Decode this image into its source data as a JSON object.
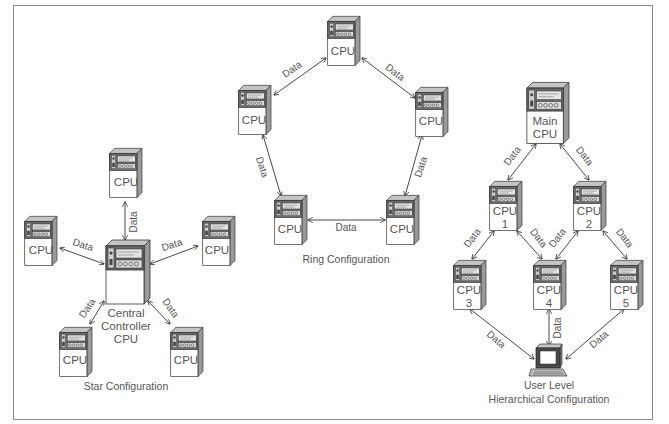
{
  "diagram": {
    "link_label": "Data",
    "cpu_label": "CPU",
    "star": {
      "caption": "Star Configuration",
      "center_lines": [
        "Central",
        "Controller",
        "CPU"
      ],
      "nodes": [
        {
          "id": "top",
          "label": "CPU"
        },
        {
          "id": "left",
          "label": "CPU"
        },
        {
          "id": "right",
          "label": "CPU"
        },
        {
          "id": "bottom-left",
          "label": "CPU"
        },
        {
          "id": "bottom-right",
          "label": "CPU"
        }
      ]
    },
    "ring": {
      "caption": "Ring Configuration",
      "nodes": [
        {
          "id": "top",
          "label": "CPU"
        },
        {
          "id": "upper-left",
          "label": "CPU"
        },
        {
          "id": "upper-right",
          "label": "CPU"
        },
        {
          "id": "lower-left",
          "label": "CPU"
        },
        {
          "id": "lower-right",
          "label": "CPU"
        }
      ]
    },
    "hierarchical": {
      "caption": "Hierarchical Configuration",
      "main_lines": [
        "Main",
        "CPU"
      ],
      "nodes": [
        {
          "id": "cpu1",
          "line1": "CPU",
          "line2": "1"
        },
        {
          "id": "cpu2",
          "line1": "CPU",
          "line2": "2"
        },
        {
          "id": "cpu3",
          "line1": "CPU",
          "line2": "3"
        },
        {
          "id": "cpu4",
          "line1": "CPU",
          "line2": "4"
        },
        {
          "id": "cpu5",
          "line1": "CPU",
          "line2": "5"
        }
      ],
      "user_level_label": "User Level"
    },
    "colors": {
      "frame": "#8a8a8a",
      "cabinet_front": "#ffffff",
      "cabinet_side": "#9a9a9a",
      "cabinet_top": "#c4c4c4",
      "panel": "#5a5a5a",
      "line": "#333333",
      "text": "#555555"
    }
  }
}
